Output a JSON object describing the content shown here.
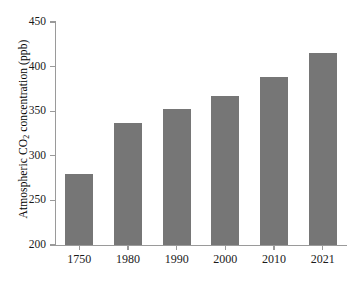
{
  "chart_data": {
    "type": "bar",
    "title": "",
    "subtitle": "",
    "xlabel": "",
    "ylabel_plain": "Atmospheric CO2 concentration (ppb)",
    "ylabel_prefix": "Atmospheric CO",
    "ylabel_subscript": "2",
    "ylabel_suffix": " concentration (ppb)",
    "categories": [
      "1750",
      "1980",
      "1990",
      "2000",
      "2010",
      "2021"
    ],
    "values": [
      280,
      337,
      352,
      367,
      388,
      415
    ],
    "ylim": [
      200,
      450
    ],
    "yticks": [
      200,
      250,
      300,
      350,
      400,
      450
    ],
    "ytick_labels": [
      "200",
      "250",
      "300",
      "350",
      "400",
      "450"
    ],
    "grid": false,
    "legend": null,
    "legend_position": "none",
    "series": [
      {
        "name": "Atmospheric CO2 concentration",
        "values": [
          280,
          337,
          352,
          367,
          388,
          415
        ]
      }
    ],
    "colors": {
      "bar_fill": "#767676",
      "axis": "#9a9a9a",
      "text": "#1a1a1a",
      "background": "#ffffff"
    }
  }
}
